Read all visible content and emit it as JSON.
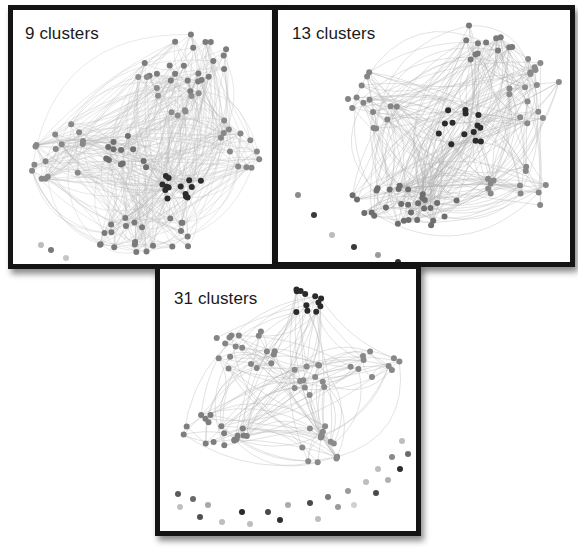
{
  "figure": {
    "panels": [
      {
        "id": "p1",
        "label": "9 clusters",
        "cluster_count": 9,
        "label_pos": [
          12,
          14
        ],
        "node_colors": [
          "#7a7a7a",
          "#888888",
          "#6e6e6e",
          "#929292",
          "#2e2e2e"
        ],
        "edge_color": "#b8b8b8",
        "edge_opacity": 0.45,
        "edge_count": 420,
        "groups": [
          {
            "cx": 175,
            "cy": 50,
            "rx": 45,
            "ry": 32,
            "n": 22,
            "shade": "#7c7c7c"
          },
          {
            "cx": 45,
            "cy": 140,
            "rx": 30,
            "ry": 45,
            "n": 16,
            "shade": "#888888"
          },
          {
            "cx": 120,
            "cy": 140,
            "rx": 30,
            "ry": 22,
            "n": 12,
            "shade": "#6f6f6f"
          },
          {
            "cx": 160,
            "cy": 175,
            "rx": 30,
            "ry": 15,
            "n": 14,
            "shade": "#2c2c2c"
          },
          {
            "cx": 230,
            "cy": 130,
            "rx": 25,
            "ry": 30,
            "n": 12,
            "shade": "#888888"
          },
          {
            "cx": 130,
            "cy": 225,
            "rx": 55,
            "ry": 20,
            "n": 22,
            "shade": "#7a7a7a"
          },
          {
            "cx": 150,
            "cy": 85,
            "rx": 40,
            "ry": 25,
            "n": 10,
            "shade": "#8c8c8c"
          }
        ],
        "isolated": [
          [
            28,
            235,
            "#bdbdbd"
          ],
          [
            38,
            240,
            "#7a7a7a"
          ],
          [
            53,
            248,
            "#c6c6c6"
          ]
        ]
      },
      {
        "id": "p2",
        "label": "13 clusters",
        "cluster_count": 13,
        "label_pos": [
          14,
          14
        ],
        "node_colors": [
          "#7a7a7a",
          "#888888",
          "#2e2e2e"
        ],
        "edge_color": "#b0b0b0",
        "edge_opacity": 0.5,
        "edge_count": 300,
        "groups": [
          {
            "cx": 195,
            "cy": 35,
            "rx": 40,
            "ry": 22,
            "n": 12,
            "shade": "#7a7a7a"
          },
          {
            "cx": 255,
            "cy": 80,
            "rx": 28,
            "ry": 35,
            "n": 16,
            "shade": "#8a8a8a"
          },
          {
            "cx": 100,
            "cy": 90,
            "rx": 35,
            "ry": 30,
            "n": 14,
            "shade": "#858585"
          },
          {
            "cx": 180,
            "cy": 120,
            "rx": 30,
            "ry": 22,
            "n": 14,
            "shade": "#2b2b2b"
          },
          {
            "cx": 125,
            "cy": 195,
            "rx": 55,
            "ry": 25,
            "n": 30,
            "shade": "#6e6e6e"
          },
          {
            "cx": 240,
            "cy": 180,
            "rx": 35,
            "ry": 25,
            "n": 12,
            "shade": "#888888"
          }
        ],
        "isolated": [
          [
            20,
            185,
            "#8a8a8a"
          ],
          [
            36,
            205,
            "#3a3a3a"
          ],
          [
            54,
            225,
            "#bcbcbc"
          ],
          [
            76,
            237,
            "#3a3a3a"
          ],
          [
            100,
            245,
            "#9a9a9a"
          ],
          [
            120,
            252,
            "#2e2e2e"
          ],
          [
            140,
            256,
            "#c8c8c8"
          ]
        ]
      },
      {
        "id": "p3",
        "label": "31 clusters",
        "cluster_count": 31,
        "label_pos": [
          14,
          20
        ],
        "node_colors": [
          "#7a7a7a",
          "#888888",
          "#2e2e2e"
        ],
        "edge_color": "#b4b4b4",
        "edge_opacity": 0.55,
        "edge_count": 140,
        "groups": [
          {
            "cx": 150,
            "cy": 35,
            "rx": 18,
            "ry": 25,
            "n": 12,
            "shade": "#2a2a2a"
          },
          {
            "cx": 85,
            "cy": 80,
            "rx": 35,
            "ry": 25,
            "n": 18,
            "shade": "#858585"
          },
          {
            "cx": 150,
            "cy": 110,
            "rx": 20,
            "ry": 20,
            "n": 12,
            "shade": "#8a8a8a"
          },
          {
            "cx": 215,
            "cy": 95,
            "rx": 25,
            "ry": 15,
            "n": 10,
            "shade": "#888888"
          },
          {
            "cx": 55,
            "cy": 165,
            "rx": 35,
            "ry": 22,
            "n": 18,
            "shade": "#7e7e7e"
          },
          {
            "cx": 160,
            "cy": 175,
            "rx": 25,
            "ry": 20,
            "n": 14,
            "shade": "#8a8a8a"
          }
        ],
        "isolated": [
          [
            18,
            225,
            "#5a5a5a"
          ],
          [
            20,
            238,
            "#c0c0c0"
          ],
          [
            33,
            230,
            "#6a6a6a"
          ],
          [
            40,
            248,
            "#505050"
          ],
          [
            48,
            236,
            "#a8a8a8"
          ],
          [
            62,
            253,
            "#bdbdbd"
          ],
          [
            82,
            243,
            "#2a2a2a"
          ],
          [
            90,
            255,
            "#bebebe"
          ],
          [
            108,
            243,
            "#4a4a4a"
          ],
          [
            120,
            251,
            "#2e2e2e"
          ],
          [
            128,
            236,
            "#aaaaaa"
          ],
          [
            150,
            234,
            "#4a4a4a"
          ],
          [
            158,
            250,
            "#bdbdbd"
          ],
          [
            168,
            228,
            "#7a7a7a"
          ],
          [
            178,
            238,
            "#9a9a9a"
          ],
          [
            188,
            222,
            "#9a9a9a"
          ],
          [
            194,
            236,
            "#d0d0d0"
          ],
          [
            206,
            213,
            "#bdbdbd"
          ],
          [
            216,
            224,
            "#4a4a4a"
          ],
          [
            218,
            200,
            "#bebebe"
          ],
          [
            228,
            211,
            "#b0b0b0"
          ],
          [
            232,
            188,
            "#8a8a8a"
          ],
          [
            240,
            200,
            "#2e2e2e"
          ],
          [
            242,
            172,
            "#bdbdbd"
          ],
          [
            248,
            185,
            "#6a6a6a"
          ]
        ]
      }
    ]
  }
}
